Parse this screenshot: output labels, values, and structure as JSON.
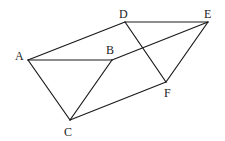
{
  "diagram": {
    "type": "geometry",
    "points": [
      {
        "id": "A",
        "x": 28,
        "y": 60,
        "label": "A",
        "lx": 15,
        "ly": 60
      },
      {
        "id": "B",
        "x": 112,
        "y": 60,
        "label": "B",
        "lx": 106,
        "ly": 54
      },
      {
        "id": "C",
        "x": 70,
        "y": 120,
        "label": "C",
        "lx": 64,
        "ly": 136
      },
      {
        "id": "D",
        "x": 125,
        "y": 22,
        "label": "D",
        "lx": 119,
        "ly": 18
      },
      {
        "id": "E",
        "x": 208,
        "y": 22,
        "label": "E",
        "lx": 204,
        "ly": 18
      },
      {
        "id": "F",
        "x": 166,
        "y": 82,
        "label": "F",
        "lx": 164,
        "ly": 97
      }
    ],
    "edges": [
      [
        "A",
        "D"
      ],
      [
        "A",
        "B"
      ],
      [
        "A",
        "C"
      ],
      [
        "B",
        "C"
      ],
      [
        "B",
        "E"
      ],
      [
        "D",
        "E"
      ],
      [
        "D",
        "F"
      ],
      [
        "E",
        "F"
      ],
      [
        "C",
        "F"
      ]
    ],
    "stroke_color": "#1a1a1a",
    "label_color": "#222222"
  }
}
